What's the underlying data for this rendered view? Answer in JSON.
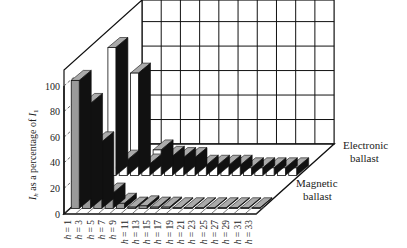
{
  "chart_data": {
    "type": "bar",
    "subtype": "3d-grouped-bar",
    "title": "",
    "ylabel": "I_h as a percentage of I_1",
    "ylabel_main": "I",
    "ylabel_sub": "h",
    "ylabel_mid": " as a percentage of ",
    "ylabel_end": "I",
    "ylabel_end_sub": "1",
    "xlabel": "",
    "ylim": [
      0,
      100
    ],
    "yticks": [
      "0",
      "20",
      "40",
      "60",
      "80",
      "100"
    ],
    "categories": [
      "h = 1",
      "h = 3",
      "h = 5",
      "h = 7",
      "h = 9",
      "h = 11",
      "h = 13",
      "h = 15",
      "h = 17",
      "h = 19",
      "h = 21",
      "h = 23",
      "h = 25",
      "h = 27",
      "h = 29",
      "h = 31",
      "h = 33"
    ],
    "series": [
      {
        "name": "Magnetic ballast",
        "color": "#9a9a9a",
        "values": [
          100,
          82,
          52,
          12,
          4,
          1,
          2,
          1,
          1,
          0.5,
          0.5,
          0.5,
          0.5,
          0.5,
          0.5,
          0.5,
          0.5
        ]
      },
      {
        "name": "Electronic ballast",
        "color": "#ffffff",
        "values": [
          100,
          12,
          80,
          9,
          20,
          15,
          14,
          14,
          8,
          8,
          8,
          8,
          6,
          6,
          6,
          6,
          6
        ]
      }
    ],
    "legend": [
      "Electronic ballast",
      "Magnetic ballast"
    ],
    "grid": true
  },
  "labels": {
    "electronic_line1": "Electronic",
    "electronic_line2": "ballast",
    "magnetic_line1": "Magnetic",
    "magnetic_line2": "ballast"
  }
}
